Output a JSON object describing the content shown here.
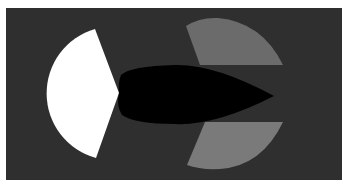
{
  "scene": {
    "width": 349,
    "height": 191,
    "outer_color": "#ffffff",
    "panel": {
      "x": 6,
      "y": 8,
      "width": 336,
      "height": 172,
      "color": "#2f2f2f"
    },
    "shapes": [
      {
        "name": "white-wedge",
        "color": "#ffffff",
        "path": "M95,29 L119,93 L96,158 A67,67 0 0 1 95,29 Z"
      },
      {
        "name": "top-gray-wedge",
        "color": "#6b6b6b",
        "path": "M186,26 Q200,17 218,18 Q262,22 283,65 L200,65 Z"
      },
      {
        "name": "bottom-gray-wedge",
        "color": "#7a7a7a",
        "path": "M205,122 L283,122 Q262,166 220,169 Q200,170 187,165 Z"
      },
      {
        "name": "black-leaf",
        "color": "#000000",
        "path": "M121,75 Q130,66 175,65 Q215,64 274,96 Q215,126 175,124 Q135,124 122,115 Q116,106 119,93 Q118,82 121,75 Z"
      }
    ]
  }
}
